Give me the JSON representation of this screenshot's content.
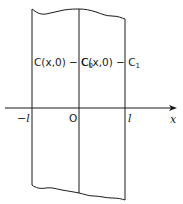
{
  "diagram": {
    "axis": {
      "label": "x",
      "ticks": [
        {
          "label": "−l",
          "position": "-l"
        },
        {
          "label": "O",
          "position": "0"
        },
        {
          "label": "l",
          "position": "l"
        }
      ]
    },
    "regions": [
      {
        "label_main": "C(x,0) − C",
        "label_sub": "0",
        "range": "-l < x < 0"
      },
      {
        "label_main": "C(x,0) − C",
        "label_sub": "1",
        "range": "0 < x < l"
      }
    ],
    "colors": {
      "line": "#1a1a1a",
      "background": "#ffffff"
    }
  }
}
